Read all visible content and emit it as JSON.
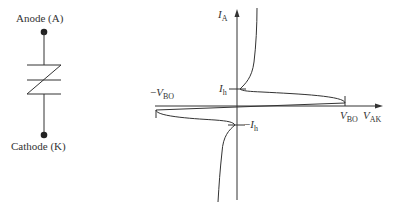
{
  "symbol": {
    "anode_label": "Anode (A)",
    "cathode_label": "Cathode (K)",
    "device": "DIAC"
  },
  "graph": {
    "y_axis": {
      "main": "I",
      "sub": "A"
    },
    "x_axis": {
      "main": "V",
      "sub": "AK"
    },
    "ih_pos": {
      "main": "I",
      "sub": "h"
    },
    "ih_neg": {
      "prefix": "−",
      "main": "I",
      "sub": "h"
    },
    "vbo_pos": {
      "main": "V",
      "sub": "BO"
    },
    "vbo_neg": {
      "prefix": "−",
      "main": "V",
      "sub": "BO"
    }
  },
  "colors": {
    "line": "#333333",
    "text": "#333333"
  }
}
